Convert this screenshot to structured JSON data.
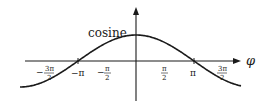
{
  "figure": {
    "curve_label": "cosine",
    "x_axis_label": "φ",
    "function": "cos(φ)",
    "x_range": [
      -3.3,
      3.3
    ],
    "y_range": [
      -1,
      1
    ],
    "x_ticks": [
      {
        "label_num": "3π",
        "label_den": "2",
        "sign": "−",
        "value": -4.712
      },
      {
        "label": "−π",
        "value": -3.1416
      },
      {
        "label_num": "π",
        "label_den": "2",
        "sign": "−",
        "value": -1.5708
      },
      {
        "label_num": "π",
        "label_den": "2",
        "sign": "",
        "value": 1.5708
      },
      {
        "label": "π",
        "value": 3.1416
      },
      {
        "label_num": "3π",
        "label_den": "2",
        "sign": "",
        "value": 4.712
      }
    ],
    "colors": {
      "curve": "#1a1a1a",
      "axes": "#1a1a1a",
      "background": "#ffffff"
    }
  }
}
